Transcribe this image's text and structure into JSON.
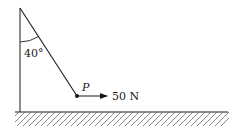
{
  "diagram": {
    "angle_label": "40°",
    "point_label": "P",
    "force_label": "50 N",
    "colors": {
      "ink": "#1a1a1a",
      "background": "#ffffff"
    }
  }
}
